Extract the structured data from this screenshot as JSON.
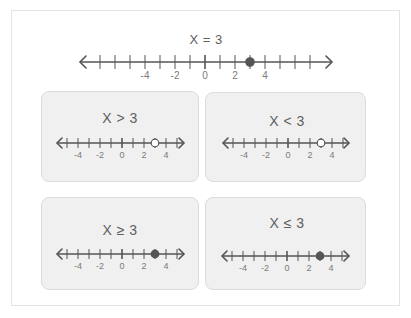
{
  "figure": {
    "main": {
      "label": "X = 3",
      "relation": "=",
      "value": 3,
      "range": [
        -7,
        7
      ],
      "tick_labels": [
        "-4",
        "-2",
        "0",
        "2",
        "4"
      ],
      "point": {
        "x": 3,
        "filled": true
      }
    },
    "cards": [
      {
        "label": "X > 3",
        "relation": ">",
        "value": 3,
        "range": [
          -5,
          5
        ],
        "tick_labels": [
          "-4",
          "-2",
          "0",
          "2",
          "4"
        ],
        "point": {
          "x": 3,
          "filled": false
        }
      },
      {
        "label": "X < 3",
        "relation": "<",
        "value": 3,
        "range": [
          -5,
          5
        ],
        "tick_labels": [
          "-4",
          "-2",
          "0",
          "2",
          "4"
        ],
        "point": {
          "x": 3,
          "filled": false
        }
      },
      {
        "label": "X ≥ 3",
        "relation": "≥",
        "value": 3,
        "range": [
          -5,
          5
        ],
        "tick_labels": [
          "-4",
          "-2",
          "0",
          "2",
          "4"
        ],
        "point": {
          "x": 3,
          "filled": true
        }
      },
      {
        "label": "X ≤ 3",
        "relation": "≤",
        "value": 3,
        "range": [
          -5,
          5
        ],
        "tick_labels": [
          "-4",
          "-2",
          "0",
          "2",
          "4"
        ],
        "point": {
          "x": 3,
          "filled": true
        }
      }
    ]
  },
  "colors": {
    "line": "#555555",
    "dot_filled": "#555555",
    "dot_open_fill": "#ffffff",
    "card_bg": "#f0f0f0",
    "card_border": "#dcdcdc",
    "frame_border": "#e4e4e4",
    "label_text": "#7a7a7a",
    "title_text": "#606060"
  }
}
